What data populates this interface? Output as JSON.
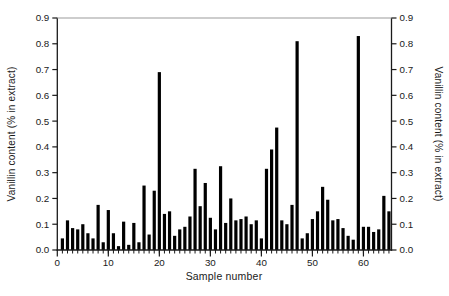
{
  "figure": {
    "xlabel": "Sample number",
    "ylabel_left": "Vanillin content (% in extract)",
    "ylabel_right": "Vanillin content (% in extract)"
  },
  "chart_data": {
    "type": "bar",
    "title": "",
    "xlabel": "Sample number",
    "ylabel": "Vanillin content (% in extract)",
    "ylabel_right": "Vanillin content (% in extract)",
    "x": [
      1,
      2,
      3,
      4,
      5,
      6,
      7,
      8,
      9,
      10,
      11,
      12,
      13,
      14,
      15,
      16,
      17,
      18,
      19,
      20,
      21,
      22,
      23,
      24,
      25,
      26,
      27,
      28,
      29,
      30,
      31,
      32,
      33,
      34,
      35,
      36,
      37,
      38,
      39,
      40,
      41,
      42,
      43,
      44,
      45,
      46,
      47,
      48,
      49,
      50,
      51,
      52,
      53,
      54,
      55,
      56,
      57,
      58,
      59,
      60,
      61,
      62,
      63,
      64,
      65
    ],
    "values": [
      0.045,
      0.115,
      0.085,
      0.08,
      0.1,
      0.065,
      0.045,
      0.175,
      0.03,
      0.155,
      0.065,
      0.015,
      0.11,
      0.02,
      0.105,
      0.03,
      0.25,
      0.06,
      0.23,
      0.69,
      0.14,
      0.15,
      0.055,
      0.08,
      0.09,
      0.13,
      0.315,
      0.17,
      0.26,
      0.125,
      0.08,
      0.325,
      0.105,
      0.2,
      0.115,
      0.12,
      0.13,
      0.1,
      0.115,
      0.045,
      0.315,
      0.39,
      0.475,
      0.115,
      0.1,
      0.175,
      0.81,
      0.045,
      0.065,
      0.12,
      0.15,
      0.245,
      0.195,
      0.115,
      0.12,
      0.085,
      0.055,
      0.04,
      0.83,
      0.09,
      0.09,
      0.07,
      0.08,
      0.21,
      0.15
    ],
    "xlim": [
      0,
      65.5
    ],
    "ylim": [
      0,
      0.9
    ],
    "x_major_ticks": [
      0,
      10,
      20,
      30,
      40,
      50,
      60
    ],
    "x_minor_tick_step": 1,
    "y_tick_labels": [
      "0.0",
      "0.1",
      "0.2",
      "0.3",
      "0.4",
      "0.5",
      "0.6",
      "0.7",
      "0.8",
      "0.9"
    ],
    "y_tick_values": [
      0,
      0.1,
      0.2,
      0.3,
      0.4,
      0.5,
      0.6,
      0.7,
      0.8,
      0.9
    ],
    "grid": "off",
    "legend": "none",
    "bar_color": "#000000",
    "axis_color": "#1a1a1a",
    "top_frame_color": "#9b9b9b"
  }
}
